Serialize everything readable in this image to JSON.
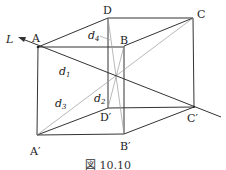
{
  "figure": {
    "caption": "図 10.10",
    "line_label": "L",
    "vertices": {
      "A": {
        "label": "A",
        "x": 38,
        "y": 47
      },
      "B": {
        "label": "B",
        "x": 124,
        "y": 46
      },
      "C": {
        "label": "C",
        "x": 193,
        "y": 18
      },
      "D": {
        "label": "D",
        "x": 108,
        "y": 18
      },
      "A_prime": {
        "label": "A′",
        "x": 37,
        "y": 135
      },
      "B_prime": {
        "label": "B′",
        "x": 124,
        "y": 134
      },
      "C_prime": {
        "label": "C′",
        "x": 194,
        "y": 107
      },
      "D_prime": {
        "label": "D′",
        "x": 108,
        "y": 108
      }
    },
    "distances": {
      "d1": {
        "base": "d",
        "sub": "1"
      },
      "d2": {
        "base": "d",
        "sub": "2"
      },
      "d3": {
        "base": "d",
        "sub": "3"
      },
      "d4": {
        "base": "d",
        "sub": "4"
      }
    },
    "colors": {
      "edge": "#333333",
      "diagonal": "#999999"
    }
  }
}
